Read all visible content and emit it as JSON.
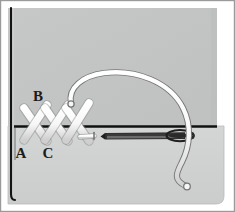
{
  "figure": {
    "width": 235,
    "height": 212
  },
  "colors": {
    "background": "#ffffff",
    "fabric_upper": "#c3c4c4",
    "fabric_lower": "#d2d3d3",
    "fabric_shadow": "#b6b7b7",
    "edge_line": "#111111",
    "border": "#9a9a9a",
    "thread_fill": "#fbfbfb",
    "thread_outline": "#6f7070",
    "needle_fill": "#e8e9e9",
    "needle_outline": "#2b2b2b",
    "label_color": "#1c1c1c"
  },
  "labels": [
    {
      "id": "label-b",
      "text": "B",
      "x": 38,
      "y": 101
    },
    {
      "id": "label-a",
      "text": "A",
      "x": 21,
      "y": 158
    },
    {
      "id": "label-c",
      "text": "C",
      "x": 48,
      "y": 158
    }
  ],
  "stitches": {
    "count": 3,
    "kind": "cross-stitch",
    "points": [
      "A",
      "B",
      "C"
    ]
  },
  "needle": {
    "orientation": "horizontal",
    "tip_side": "left",
    "eye_side": "right",
    "length_px": 80
  },
  "thread": {
    "path": "arc-over-top",
    "free_end": "bottom-right"
  }
}
